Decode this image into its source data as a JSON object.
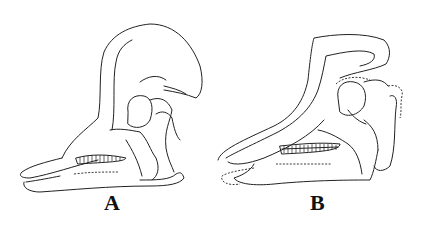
{
  "figure": {
    "panels": [
      {
        "id": "A",
        "label": "A",
        "subject": "skull line drawing, lateral view, tall rounded crest"
      },
      {
        "id": "B",
        "label": "B",
        "subject": "skull line drawing, lateral view, tubular backswept crest with dashed reconstructed outlines"
      }
    ]
  }
}
